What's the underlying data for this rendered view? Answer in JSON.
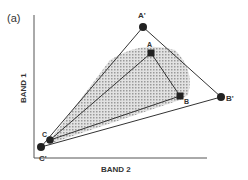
{
  "panel_label": "(a)",
  "axes": {
    "y_label": "BAND 1",
    "x_label": "BAND 2"
  },
  "points": [
    {
      "id": "A'",
      "label": "A'",
      "x": 143,
      "y": 27,
      "shape": "circle"
    },
    {
      "id": "A",
      "label": "A",
      "x": 151,
      "y": 53,
      "shape": "square"
    },
    {
      "id": "B",
      "label": "B",
      "x": 180,
      "y": 96,
      "shape": "square"
    },
    {
      "id": "B'",
      "label": "B'",
      "x": 221,
      "y": 97,
      "shape": "circle"
    },
    {
      "id": "C",
      "label": "C",
      "x": 50,
      "y": 140,
      "shape": "circle"
    },
    {
      "id": "C'",
      "label": "C'",
      "x": 41,
      "y": 147,
      "shape": "circle"
    }
  ],
  "colors": {
    "line": "#333333",
    "shade": "#bdbdbd",
    "background": "#ffffff"
  }
}
